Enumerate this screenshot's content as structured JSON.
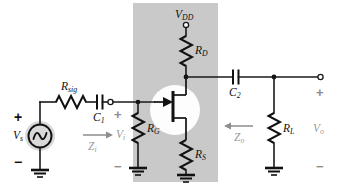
{
  "figure": {
    "type": "schematic",
    "canvas": {
      "width": 344,
      "height": 194,
      "background": "#ffffff"
    },
    "shaded_region": {
      "color": "#c9c9c9",
      "x": 133,
      "y": 3,
      "width": 85,
      "height": 179
    }
  },
  "labels": {
    "supply": {
      "name": "V",
      "sub": "DD"
    },
    "drain_resistor": {
      "name": "R",
      "sub": "D"
    },
    "source_resistor": {
      "name": "R",
      "sub": "S"
    },
    "gate_resistor": {
      "name": "R",
      "sub": "G"
    },
    "signal_resistor": {
      "name": "R",
      "sub": "sig"
    },
    "load_resistor": {
      "name": "R",
      "sub": "L"
    },
    "coupling_cap_in": {
      "name": "C",
      "sub": "1"
    },
    "coupling_cap_out": {
      "name": "C",
      "sub": "2"
    },
    "source_voltage": {
      "name": "V",
      "sub": "s"
    },
    "input_voltage": {
      "name": "V",
      "sub": "i"
    },
    "output_voltage": {
      "name": "V",
      "sub": "o"
    },
    "input_impedance": {
      "name": "Z",
      "sub": "i"
    },
    "output_impedance": {
      "name": "Z",
      "sub": "o"
    }
  },
  "polarity": {
    "source_plus": "+",
    "source_minus": "−",
    "input_plus": "+",
    "input_minus": "−",
    "output_plus": "+",
    "output_minus": "−"
  },
  "components": [
    {
      "id": "Rsig",
      "kind": "resistor",
      "label": "R_sig"
    },
    {
      "id": "RD",
      "kind": "resistor",
      "label": "R_D"
    },
    {
      "id": "RS",
      "kind": "resistor",
      "label": "R_S"
    },
    {
      "id": "RG",
      "kind": "resistor",
      "label": "R_G"
    },
    {
      "id": "RL",
      "kind": "resistor",
      "label": "R_L"
    },
    {
      "id": "C1",
      "kind": "capacitor",
      "label": "C_1"
    },
    {
      "id": "C2",
      "kind": "capacitor",
      "label": "C_2"
    },
    {
      "id": "Q1",
      "kind": "n-channel-jfet",
      "label": ""
    },
    {
      "id": "Vs",
      "kind": "ac-source",
      "label": "V_s"
    }
  ],
  "colors": {
    "wire": "#1a1a1a",
    "component": "#111111",
    "shade": "#c9c9c9",
    "annotation_gray": "#8d8d8d",
    "halo": "#fdfdfd"
  }
}
